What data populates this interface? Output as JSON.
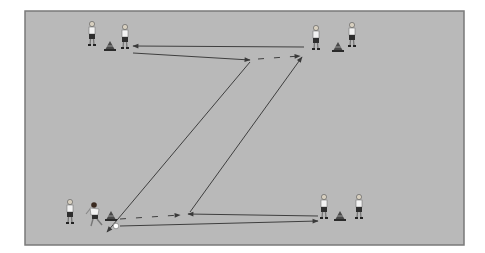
{
  "diagram": {
    "colors": {
      "pitch": "#b9b9b9",
      "pitch_border": "#7a7a7a",
      "line": "#3f3f3f",
      "shirt": "#f2f2f2",
      "shorts": "#2e2e2e",
      "cone": "#4a4a4a",
      "ball": "#ffffff"
    },
    "groups": [
      {
        "name": "top-left",
        "players": 2,
        "cone": true,
        "ball": false
      },
      {
        "name": "top-right",
        "players": 2,
        "cone": true,
        "ball": false
      },
      {
        "name": "bottom-left",
        "players": 2,
        "cone": true,
        "ball": true
      },
      {
        "name": "bottom-right",
        "players": 2,
        "cone": true,
        "ball": false
      }
    ],
    "movements": [
      {
        "type": "pass",
        "from": "top-right",
        "to": "top-left",
        "style": "solid"
      },
      {
        "type": "run",
        "from": "top-left",
        "to": "top-center",
        "style": "solid"
      },
      {
        "type": "dribble",
        "from": "top-center",
        "to": "top-right",
        "style": "dashed"
      },
      {
        "type": "pass",
        "from": "top-center",
        "to": "bottom-left",
        "style": "solid"
      },
      {
        "type": "pass",
        "from": "bottom-left",
        "to": "bottom-right",
        "style": "solid"
      },
      {
        "type": "run",
        "from": "bottom-right",
        "to": "bottom-center",
        "style": "solid"
      },
      {
        "type": "dribble",
        "from": "bottom-left",
        "to": "bottom-center",
        "style": "dashed"
      },
      {
        "type": "pass",
        "from": "bottom-center",
        "to": "top-right",
        "style": "solid"
      }
    ]
  }
}
